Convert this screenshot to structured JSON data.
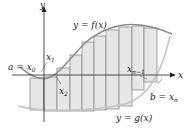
{
  "figure": {
    "axes": {
      "x_label": "x",
      "y_label": "y"
    },
    "curves": {
      "f_label": "y = f(x)",
      "g_label": "y = g(x)"
    },
    "points": {
      "a_label": "a = x",
      "a_sub": "0",
      "x1_label": "x",
      "x1_sub": "1",
      "x2_label": "x",
      "x2_sub": "2",
      "xn1_label": "x",
      "xn1_sub": "n−1",
      "b_label": "b = x",
      "b_sub": "n"
    },
    "colors": {
      "rect_fill": "#e6e6e6",
      "rect_stroke": "#8a8a8a",
      "curve_f": "#888888",
      "curve_g": "#c4c4c4",
      "axis": "#222222"
    },
    "rectangle_count": 11
  }
}
